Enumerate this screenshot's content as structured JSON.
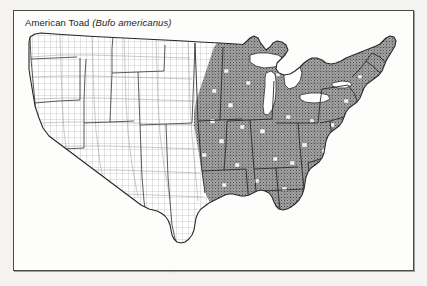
{
  "figure": {
    "common_name": "American Toad",
    "scientific_name": "(Bufo americanus)",
    "title_full": "American Toad (Bufo americanus)"
  },
  "map": {
    "region": "continental-united-states",
    "unit_level": "county",
    "projection_note": "conic",
    "legend_note_shaded": "shaded = species recorded",
    "legend_note_unshaded": "unshaded = no record",
    "colors": {
      "range_fill": "#8d8d8d",
      "range_stipple": "#5a5a5a",
      "no_range_fill": "#ffffff",
      "county_line": "#9a9a9a",
      "state_line": "#3a3a3a",
      "coast_line": "#2b2b2b",
      "water_fill": "#ffffff",
      "frame_line": "#4a4a4a",
      "page_background": "#f4f3f1",
      "figure_background": "#fdfdfc"
    },
    "range_summary": {
      "present_regions": [
        "New England",
        "Mid-Atlantic",
        "Appalachians",
        "Great Lakes",
        "Upper Midwest",
        "Ohio Valley",
        "Southeast (northern)",
        "Eastern Great Plains"
      ],
      "absent_regions": [
        "Pacific Coast",
        "Great Basin",
        "Southwest",
        "Rocky Mountains",
        "Texas (most)",
        "Southern Florida"
      ],
      "western_limit_note": "eastern Dakotas through eastern Kansas and Oklahoma",
      "southern_limit_note": "north Florida panhandle and Gulf coastal plain"
    }
  }
}
